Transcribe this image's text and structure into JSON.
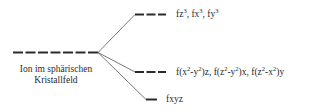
{
  "diagram": {
    "source_level": {
      "label_line1": "Ion im sphärischen",
      "label_line2": "Kristallfeld",
      "orbital_count": 7
    },
    "levels": [
      {
        "name": "upper",
        "orbital_count": 3,
        "label": [
          {
            "t": "fz"
          },
          {
            "s": "3"
          },
          {
            "t": ", fx"
          },
          {
            "s": "3"
          },
          {
            "t": ", fy"
          },
          {
            "s": "3"
          }
        ]
      },
      {
        "name": "middle",
        "orbital_count": 3,
        "label": [
          {
            "t": "f(x"
          },
          {
            "s": "2"
          },
          {
            "t": "-y"
          },
          {
            "s": "2"
          },
          {
            "t": ")z, f(z"
          },
          {
            "s": "2"
          },
          {
            "t": "-y"
          },
          {
            "s": "2"
          },
          {
            "t": ")x, f(z"
          },
          {
            "s": "2"
          },
          {
            "t": "-x"
          },
          {
            "s": "2"
          },
          {
            "t": ")y"
          }
        ]
      },
      {
        "name": "lower",
        "orbital_count": 1,
        "label": [
          {
            "t": "fxyz"
          }
        ]
      }
    ],
    "colors": {
      "line": "#2a2a2a",
      "connector": "#555555"
    }
  }
}
